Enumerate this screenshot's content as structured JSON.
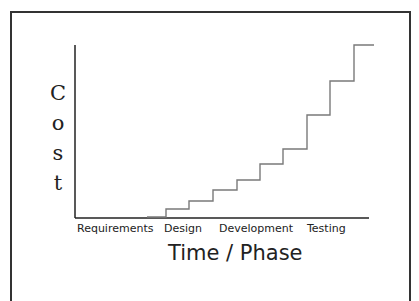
{
  "chart_data": {
    "type": "line",
    "subtype": "step",
    "title": "",
    "xlabel": "Time / Phase",
    "ylabel": "Cost",
    "ylabel_letters": [
      "C",
      "o",
      "s",
      "t"
    ],
    "categories": [
      "Requirements",
      "Design",
      "Development",
      "Testing"
    ],
    "grid": false,
    "legend": null,
    "ylim": [
      0,
      10
    ],
    "steps": [
      {
        "x_start": 0.25,
        "x_end": 0.31,
        "y": 0.1
      },
      {
        "x_start": 0.31,
        "x_end": 0.39,
        "y": 0.5
      },
      {
        "x_start": 0.39,
        "x_end": 0.47,
        "y": 1.0
      },
      {
        "x_start": 0.47,
        "x_end": 0.55,
        "y": 1.6
      },
      {
        "x_start": 0.55,
        "x_end": 0.63,
        "y": 2.2
      },
      {
        "x_start": 0.63,
        "x_end": 0.71,
        "y": 3.1
      },
      {
        "x_start": 0.71,
        "x_end": 0.79,
        "y": 4.0
      },
      {
        "x_start": 0.79,
        "x_end": 0.87,
        "y": 5.9
      },
      {
        "x_start": 0.87,
        "x_end": 0.95,
        "y": 7.9
      },
      {
        "x_start": 0.95,
        "x_end": 1.02,
        "y": 10.0
      }
    ]
  },
  "plot": {
    "line_color": "#7a7a7a",
    "axis_color": "#222222",
    "frame_color": "#333333",
    "step_path_points": [
      [
        147,
        217
      ],
      [
        166,
        217
      ],
      [
        166,
        209
      ],
      [
        189,
        209
      ],
      [
        189,
        201
      ],
      [
        213,
        201
      ],
      [
        213,
        190
      ],
      [
        237,
        190
      ],
      [
        237,
        180
      ],
      [
        260,
        180
      ],
      [
        260,
        164
      ],
      [
        283,
        164
      ],
      [
        283,
        149
      ],
      [
        307,
        149
      ],
      [
        307,
        115
      ],
      [
        330,
        115
      ],
      [
        330,
        81
      ],
      [
        354,
        81
      ],
      [
        354,
        45
      ],
      [
        374,
        45
      ]
    ]
  }
}
